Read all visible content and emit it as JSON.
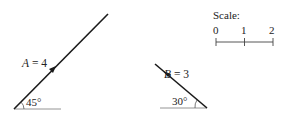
{
  "vectors": [
    {
      "name": "A",
      "label": "A = 4",
      "label_var": "A",
      "label_rest": " = 4",
      "magnitude": 4,
      "angle_label": "45°",
      "angle_deg": 45,
      "direction": "up-right"
    },
    {
      "name": "B",
      "label": "B = 3",
      "label_var": "B",
      "label_rest": " = 3",
      "magnitude": 3,
      "angle_label": "30°",
      "angle_deg": 30,
      "direction": "up-left"
    }
  ],
  "scale": {
    "title": "Scale:",
    "ticks": [
      "0",
      "1",
      "2"
    ]
  },
  "colors": {
    "line": "#1a1a1a",
    "base": "#888888",
    "text": "#222222"
  }
}
